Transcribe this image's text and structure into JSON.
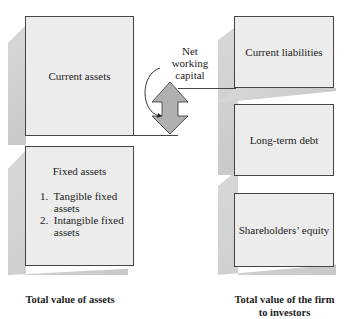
{
  "left_column": {
    "current_assets": "Current assets",
    "fixed_assets": {
      "title": "Fixed assets",
      "items": [
        "1.  Tangible fixed",
        "     assets",
        "2.  Intangible fixed",
        "     assets"
      ]
    },
    "caption": "Total value of assets"
  },
  "right_column": {
    "current_liabilities": "Current liabilities",
    "long_term_debt": "Long-term debt",
    "shareholders_equity": "Shareholders’ equity",
    "caption_line1": "Total value of the firm",
    "caption_line2": "to investors"
  },
  "connector": {
    "label_line1": "Net",
    "label_line2": "working",
    "label_line3": "capital",
    "arrow_fill": "#b0b0b0"
  }
}
